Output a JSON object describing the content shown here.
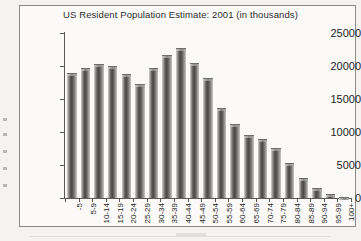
{
  "chart_data": {
    "type": "bar",
    "title": "US Resident Population Estimate: 2001 (in thousands)",
    "xlabel": "",
    "ylabel": "Population",
    "ylim": [
      0,
      25000
    ],
    "yticks": [
      0,
      5000,
      10000,
      15000,
      20000,
      25000
    ],
    "ytick_labels": [
      "0",
      "5000",
      "10000",
      "15000",
      "20000",
      "25000"
    ],
    "grid": false,
    "legend": "none",
    "categories": [
      "-5",
      "5-9",
      "10-14",
      "15-19",
      "20-24",
      "25-29",
      "30-34",
      "35-39",
      "40-44",
      "45-49",
      "50-54",
      "55-59",
      "60-64",
      "65-69",
      "70-74",
      "75-79",
      "80-84",
      "85-89",
      "90-94",
      "95-99",
      "100+"
    ],
    "values": [
      18900,
      19750,
      20350,
      20050,
      18800,
      17300,
      19650,
      21700,
      22800,
      20400,
      18250,
      13700,
      11150,
      9600,
      8900,
      7650,
      5350,
      3050,
      1500,
      600,
      100
    ]
  }
}
